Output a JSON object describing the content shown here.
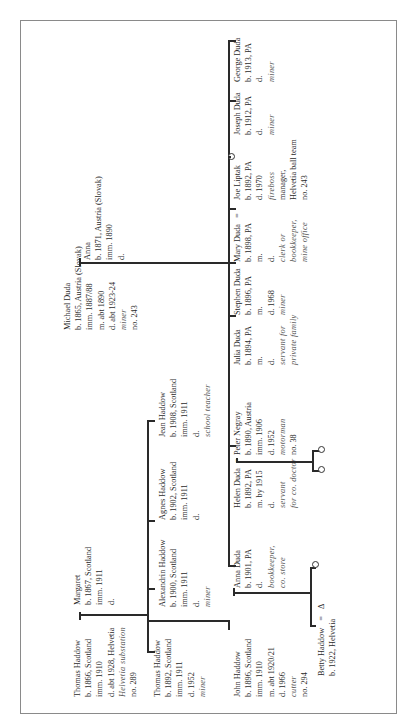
{
  "diagram": {
    "type": "family-tree",
    "orientation": "rotated-90-ccw",
    "caption_note": "",
    "gen1": {
      "duda": {
        "husband": {
          "name": "Michael Duda",
          "lines": [
            "b. 1865, Austria (Slovak)",
            "imm. 1887/88",
            "m. abt 1890",
            "d. abt 1923-24"
          ],
          "italic": [
            "miner"
          ],
          "extra": [
            "no. 243"
          ]
        },
        "wife": {
          "name": "Anna",
          "lines": [
            "b. 1871, Austria (Slovak)",
            "imm. 1890",
            "d."
          ],
          "italic": [],
          "extra": []
        }
      },
      "haddow": {
        "husband": {
          "name": "Thomas Haddow",
          "lines": [
            "b. 1866, Scotland",
            "imm. 1910",
            "d. abt 1928, Helvetia"
          ],
          "italic": [
            "Helvetia  substation"
          ],
          "extra": [
            "no. 289"
          ]
        },
        "wife": {
          "name": "Margaret",
          "lines": [
            "b. 1867, Scotland",
            "imm. 1911",
            "d."
          ],
          "italic": [],
          "extra": []
        }
      }
    },
    "haddow_children": [
      {
        "name": "Thomas Haddow",
        "lines": [
          "b. 1892, Scotland",
          "imm. 1911",
          "d. 1952"
        ],
        "italic": [
          "miner"
        ]
      },
      {
        "name": "John Haddow",
        "lines": [
          "b. 1896, Scotland",
          "imm. 1910",
          "m. abt 1920/21",
          "d. 1966"
        ],
        "italic": [
          "cutter"
        ],
        "extra": [
          "no. 294"
        ]
      },
      {
        "name": "Alexandrin Haddow",
        "lines": [
          "b. 1900, Scotland",
          "imm. 1911",
          "d."
        ],
        "italic": [
          "miner"
        ]
      },
      {
        "name": "Agnes Haddow",
        "lines": [
          "b. 1902, Scotland",
          "imm. 1911",
          "d."
        ],
        "italic": []
      },
      {
        "name": "Jean Haddow",
        "lines": [
          "b. 1908, Scotland",
          "imm. 1911",
          "d."
        ],
        "italic": [
          "school  teacher"
        ]
      }
    ],
    "duda_children": [
      {
        "name": "Anna Duda",
        "lines": [
          "b. 1901, PA",
          "d."
        ],
        "italic": [
          "bookkeeper,",
          "co. store"
        ]
      },
      {
        "name": "Helen Duda",
        "lines": [
          "b. 1892, PA",
          "m. by 1915",
          "d."
        ],
        "italic": [
          "servant",
          "for co. doctor"
        ]
      },
      {
        "name": "Julia Duda",
        "lines": [
          "b. 1894, PA",
          "m.",
          "d."
        ],
        "italic": [
          "servant  for",
          "private  family"
        ]
      },
      {
        "name": "Stephen Duda",
        "lines": [
          "b. 1896, PA",
          "m.",
          "d. 1968"
        ],
        "italic": [
          "miner"
        ]
      },
      {
        "name": "Mary Duda",
        "lines": [
          "b. 1898, PA",
          "m.",
          "d."
        ],
        "italic": [
          "clerk or",
          "bookkeeper,",
          "mine  office"
        ]
      },
      {
        "name": "Joseph Duda",
        "lines": [
          "b. 1912, PA",
          "d."
        ],
        "italic": [
          "miner"
        ]
      },
      {
        "name": "George Duda",
        "lines": [
          "b. 1913, PA",
          "d."
        ],
        "italic": [
          "miner"
        ]
      }
    ],
    "spouses": {
      "peter": {
        "name": "Peter Negray",
        "lines": [
          "b. 1890, Austria",
          "imm. 1906",
          "d. 1952"
        ],
        "italic": [
          "motorman"
        ],
        "extra": [
          "no. 38"
        ]
      },
      "joe": {
        "name": "Joe Liptak",
        "lines": [
          "b. 1892, PA",
          "d. 1970"
        ],
        "italic": [
          "fireboss"
        ],
        "extra": [
          "manager,",
          "Helvetia  ball  team",
          "no. 243"
        ]
      }
    },
    "grandchild": {
      "name": "Betty Haddow",
      "lines": [
        "b. 1922, Helvetia"
      ]
    },
    "symbols": {
      "marriage": "=",
      "male": "Δ",
      "female": "○"
    }
  }
}
